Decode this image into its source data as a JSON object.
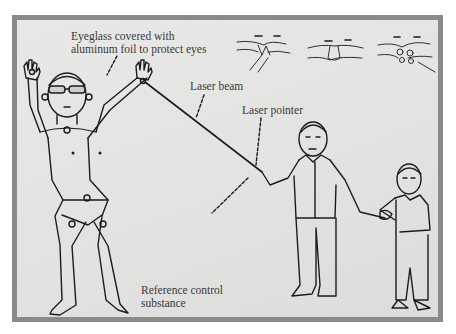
{
  "figure": {
    "labels": {
      "eyeglass_line1": "Eyeglass covered with",
      "eyeglass_line2": "aluminum foil to protect eyes",
      "laser_beam": "Laser beam",
      "laser_pointer": "Laser pointer",
      "reference_line1": "Reference control",
      "reference_line2": "substance"
    },
    "body_markers": [
      "1",
      "2",
      "3",
      "4",
      "5",
      "6",
      "7",
      "8"
    ],
    "colors": {
      "frame_border": "#8a8a8a",
      "paper": "#e4e4e2",
      "ink": "#1c1c1c",
      "text": "#3a3a3a"
    },
    "inset_panels": [
      "hand-technique-1",
      "hand-technique-2",
      "hand-technique-3"
    ]
  }
}
